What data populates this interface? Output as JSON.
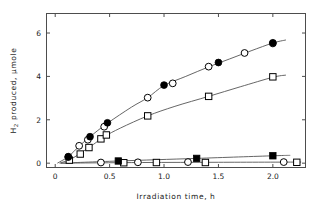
{
  "chart_data": {
    "type": "scatter",
    "title": "",
    "xlabel": "Irradiation time, h",
    "ylabel_html": "H2 produced, μmole",
    "ylabel_main": "H",
    "ylabel_sub": "2",
    "ylabel_rest": " produced, μmole",
    "xlim": [
      -0.08,
      2.3
    ],
    "ylim": [
      -0.2,
      6.9
    ],
    "xticks": [
      0,
      0.5,
      1.0,
      1.5,
      2.0
    ],
    "xtick_labels": [
      "0",
      "0.5",
      "1.0",
      "1.5",
      "2.0"
    ],
    "yticks": [
      0,
      2,
      4,
      6
    ],
    "ytick_labels": [
      "0",
      "2",
      "4",
      "6"
    ],
    "grid": false,
    "legend": "none",
    "series": [
      {
        "name": "filled-circle-series",
        "marker": "filled-circle",
        "color": "#000000",
        "points": [
          {
            "x": 0.12,
            "y": 0.3
          },
          {
            "x": 0.32,
            "y": 1.22
          },
          {
            "x": 0.48,
            "y": 1.86
          },
          {
            "x": 1.0,
            "y": 3.6
          },
          {
            "x": 1.5,
            "y": 4.64
          },
          {
            "x": 2.0,
            "y": 5.55
          }
        ]
      },
      {
        "name": "open-circle-series",
        "marker": "open-circle",
        "color": "#000000",
        "points": [
          {
            "x": 0.12,
            "y": 0.28
          },
          {
            "x": 0.22,
            "y": 0.8
          },
          {
            "x": 0.3,
            "y": 1.08
          },
          {
            "x": 0.45,
            "y": 1.68
          },
          {
            "x": 0.85,
            "y": 3.02
          },
          {
            "x": 1.08,
            "y": 3.68
          },
          {
            "x": 1.41,
            "y": 4.45
          },
          {
            "x": 1.74,
            "y": 5.08
          },
          {
            "x": 2.0,
            "y": 5.52
          }
        ]
      },
      {
        "name": "open-square-series",
        "marker": "open-square",
        "color": "#000000",
        "points": [
          {
            "x": 0.13,
            "y": 0.14
          },
          {
            "x": 0.23,
            "y": 0.42
          },
          {
            "x": 0.31,
            "y": 0.72
          },
          {
            "x": 0.42,
            "y": 1.12
          },
          {
            "x": 0.47,
            "y": 1.3
          },
          {
            "x": 0.85,
            "y": 2.18
          },
          {
            "x": 1.41,
            "y": 3.08
          },
          {
            "x": 2.0,
            "y": 3.98
          }
        ]
      },
      {
        "name": "filled-square-series",
        "marker": "filled-square",
        "color": "#000000",
        "points": [
          {
            "x": 0.58,
            "y": 0.1
          },
          {
            "x": 1.3,
            "y": 0.22
          },
          {
            "x": 2.0,
            "y": 0.34
          }
        ]
      },
      {
        "name": "baseline-open-circle-series",
        "marker": "open-circle",
        "color": "#000000",
        "points": [
          {
            "x": 0.42,
            "y": 0.03
          },
          {
            "x": 0.76,
            "y": 0.04
          },
          {
            "x": 1.22,
            "y": 0.05
          },
          {
            "x": 2.1,
            "y": 0.05
          }
        ]
      },
      {
        "name": "baseline-open-square-series",
        "marker": "open-square",
        "color": "#000000",
        "points": [
          {
            "x": 0.63,
            "y": 0.02
          },
          {
            "x": 0.93,
            "y": 0.03
          },
          {
            "x": 1.38,
            "y": 0.03
          },
          {
            "x": 2.22,
            "y": 0.04
          }
        ]
      }
    ],
    "curves": [
      {
        "name": "upper-curve",
        "path": [
          {
            "x": 0.02,
            "y": 0.0
          },
          {
            "x": 0.12,
            "y": 0.3
          },
          {
            "x": 0.22,
            "y": 0.78
          },
          {
            "x": 0.32,
            "y": 1.22
          },
          {
            "x": 0.48,
            "y": 1.84
          },
          {
            "x": 0.7,
            "y": 2.58
          },
          {
            "x": 0.85,
            "y": 3.02
          },
          {
            "x": 1.0,
            "y": 3.58
          },
          {
            "x": 1.2,
            "y": 4.0
          },
          {
            "x": 1.41,
            "y": 4.44
          },
          {
            "x": 1.6,
            "y": 4.8
          },
          {
            "x": 1.8,
            "y": 5.18
          },
          {
            "x": 2.0,
            "y": 5.54
          },
          {
            "x": 2.12,
            "y": 5.68
          }
        ]
      },
      {
        "name": "middle-curve",
        "path": [
          {
            "x": 0.04,
            "y": 0.0
          },
          {
            "x": 0.15,
            "y": 0.2
          },
          {
            "x": 0.25,
            "y": 0.52
          },
          {
            "x": 0.35,
            "y": 0.86
          },
          {
            "x": 0.45,
            "y": 1.22
          },
          {
            "x": 0.6,
            "y": 1.62
          },
          {
            "x": 0.85,
            "y": 2.18
          },
          {
            "x": 1.1,
            "y": 2.62
          },
          {
            "x": 1.41,
            "y": 3.08
          },
          {
            "x": 1.7,
            "y": 3.52
          },
          {
            "x": 2.0,
            "y": 3.96
          },
          {
            "x": 2.12,
            "y": 4.06
          }
        ]
      },
      {
        "name": "lower-curve",
        "path": [
          {
            "x": 0.05,
            "y": 0.0
          },
          {
            "x": 0.58,
            "y": 0.1
          },
          {
            "x": 1.3,
            "y": 0.22
          },
          {
            "x": 2.0,
            "y": 0.34
          },
          {
            "x": 2.16,
            "y": 0.36
          }
        ]
      },
      {
        "name": "baseline-curve",
        "path": [
          {
            "x": 0.05,
            "y": 0.0
          },
          {
            "x": 0.8,
            "y": 0.03
          },
          {
            "x": 1.5,
            "y": 0.04
          },
          {
            "x": 2.26,
            "y": 0.05
          }
        ]
      }
    ]
  },
  "plot": {
    "frame_color": "#4d4d4d",
    "marker_color": "#000000",
    "line_color": "#555555"
  }
}
